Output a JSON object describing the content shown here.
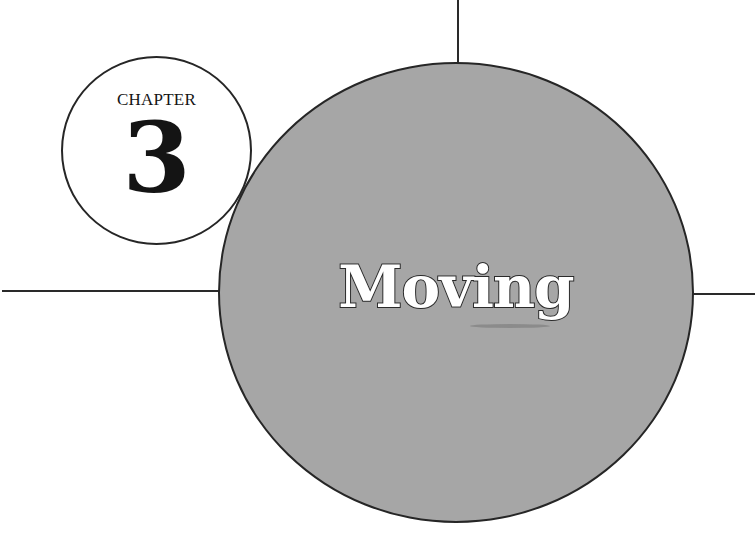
{
  "chapter": {
    "label": "CHAPTER",
    "number": "3",
    "title": "Moving"
  },
  "colors": {
    "circle_fill": "#a6a6a6",
    "badge_fill": "#ffffff",
    "stroke": "#262626",
    "title_fill": "#ffffff"
  }
}
